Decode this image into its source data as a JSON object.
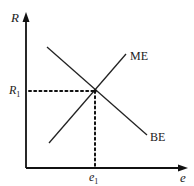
{
  "diagram": {
    "y_axis_label": "R",
    "x_axis_label": "e",
    "curves": [
      {
        "name": "ME",
        "label": "ME",
        "slope": "upward"
      },
      {
        "name": "BE",
        "label": "BE",
        "slope": "downward"
      }
    ],
    "equilibrium": {
      "y_label": "R",
      "y_sub": "1",
      "x_label": "e",
      "x_sub": "1"
    }
  }
}
